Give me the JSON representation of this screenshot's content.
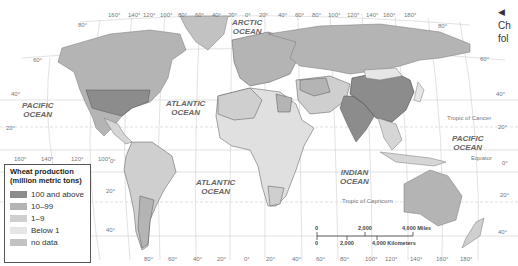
{
  "map": {
    "title_visible": false,
    "oceans": [
      {
        "id": "arctic",
        "lines": [
          "ARCTIC",
          "OCEAN"
        ],
        "x": 245,
        "y": 18
      },
      {
        "id": "pacific-west",
        "lines": [
          "PACIFIC",
          "OCEAN"
        ],
        "x": 34,
        "y": 102
      },
      {
        "id": "atlantic-north",
        "lines": [
          "ATLANTIC",
          "OCEAN"
        ],
        "x": 166,
        "y": 100
      },
      {
        "id": "atlantic-south",
        "lines": [
          "ATLANTIC",
          "OCEAN"
        ],
        "x": 196,
        "y": 178
      },
      {
        "id": "indian",
        "lines": [
          "INDIAN",
          "OCEAN"
        ],
        "x": 346,
        "y": 168
      },
      {
        "id": "pacific-east",
        "lines": [
          "PACIFIC",
          "OCEAN"
        ],
        "x": 448,
        "y": 135
      }
    ],
    "reference_lines": {
      "tropic_of_cancer": "Tropic of Cancer",
      "equator": "Equator",
      "tropic_of_capricorn": "Tropic of Capricorn"
    },
    "top_longitudes": [
      "160°",
      "140°",
      "120°",
      "100°",
      "80°",
      "60°",
      "40°",
      "20°",
      "0°",
      "20°",
      "40°",
      "60°",
      "80°",
      "100°",
      "120°",
      "140°",
      "160°",
      "180°"
    ],
    "bottom_longitudes": [
      "80°",
      "60°",
      "40°",
      "20°",
      "0°",
      "20°",
      "40°",
      "60°",
      "80°",
      "100°",
      "120°",
      "140°",
      "160°",
      "180°"
    ],
    "left_pacific_longitudes": [
      "160°",
      "140°",
      "120°",
      "100°"
    ],
    "latitudes_left": [
      "80°",
      "60°",
      "40°",
      "20°",
      "0°",
      "20°",
      "40°"
    ],
    "latitudes_right": [
      "80°",
      "60°",
      "40°",
      "20°",
      "0°",
      "20°",
      "40°"
    ]
  },
  "legend": {
    "title_line1": "Wheat production",
    "title_line2": "(million metric tons)",
    "items": [
      {
        "label": "100 and above",
        "color": "#8c8c8c"
      },
      {
        "label": "10–99",
        "color": "#b4b4b4"
      },
      {
        "label": "1–9",
        "color": "#cfcfcf"
      },
      {
        "label": "Below 1",
        "color": "#e6e6e6"
      },
      {
        "label": "no data",
        "color": "#c2c2c2"
      }
    ]
  },
  "scale_bar": {
    "miles_0": "0",
    "miles_2000": "2,000",
    "miles_4000": "4,000 Miles",
    "km_0": "0",
    "km_2000": "2,000",
    "km_4000": "4,000 Kilometers"
  },
  "aside": {
    "arrow": "◀",
    "line1": "Ch",
    "line2": "fol"
  }
}
